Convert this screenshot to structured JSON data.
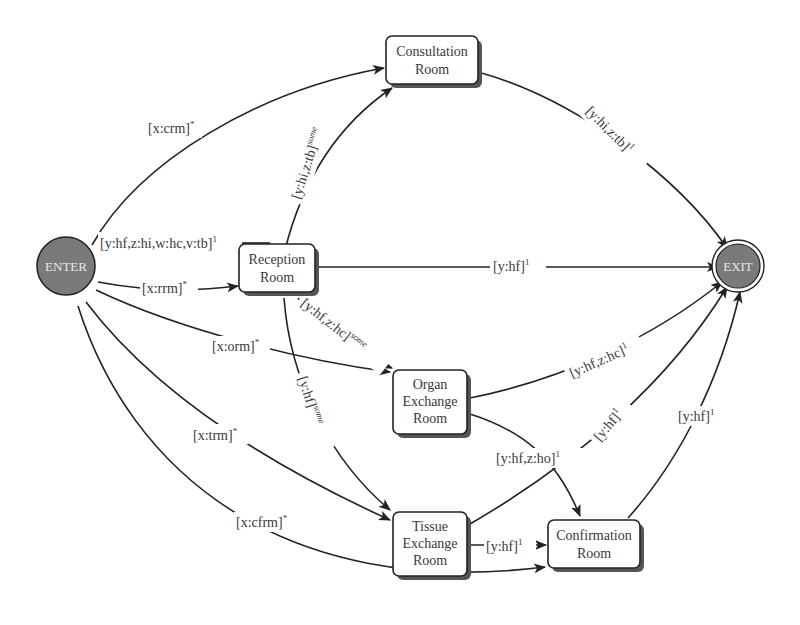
{
  "diagram": {
    "type": "state-transition-graph",
    "nodes": {
      "enter": {
        "label": "ENTER",
        "shape": "circle",
        "fill": "#7a7a7a"
      },
      "exit": {
        "label": "EXIT",
        "shape": "double-circle",
        "fill": "#7a7a7a"
      },
      "consultation": {
        "line1": "Consultation",
        "line2": "Room"
      },
      "reception": {
        "line1": "Reception",
        "line2": "Room"
      },
      "organ": {
        "line1": "Organ",
        "line2": "Exchange",
        "line3": "Room"
      },
      "tissue": {
        "line1": "Tissue",
        "line2": "Exchange",
        "line3": "Room"
      },
      "confirmation": {
        "line1": "Confirmation",
        "line2": "Room"
      }
    },
    "edges": {
      "enter_consultation": {
        "text": "[x:crm]",
        "sup": "*"
      },
      "enter_exit": {
        "text": "[y:hf,z:hi,w:hc,v:tb]",
        "sup": "1"
      },
      "enter_reception": {
        "text": "[x:rrm]",
        "sup": "*"
      },
      "enter_organ": {
        "text": "[x:orm]",
        "sup": "*"
      },
      "enter_tissue": {
        "text": "[x:trm]",
        "sup": "*"
      },
      "enter_confirmation": {
        "text": "[x:cfrm]",
        "sup": "*"
      },
      "reception_consultation": {
        "text": "[y:hi,z:tb]",
        "sup": "some"
      },
      "reception_exit": {
        "text": "[y:hf]",
        "sup": "1"
      },
      "reception_organ": {
        "text": "[y:hf,z:hc]",
        "sup": "some"
      },
      "reception_tissue": {
        "text": "[y:hf]",
        "sup": "some"
      },
      "consultation_exit": {
        "text": "[y:hi,z:tb]",
        "sup": "1"
      },
      "organ_exit": {
        "text": "[y:hf,z:hc]",
        "sup": "1"
      },
      "organ_confirmation": {
        "text": "[y:hf,z:ho]",
        "sup": "1"
      },
      "tissue_exit": {
        "text": "[y:hf]",
        "sup": "1"
      },
      "tissue_confirmation": {
        "text": "[y:hf]",
        "sup": "1"
      },
      "confirmation_exit": {
        "text": "[y:hf]",
        "sup": "1"
      }
    }
  }
}
